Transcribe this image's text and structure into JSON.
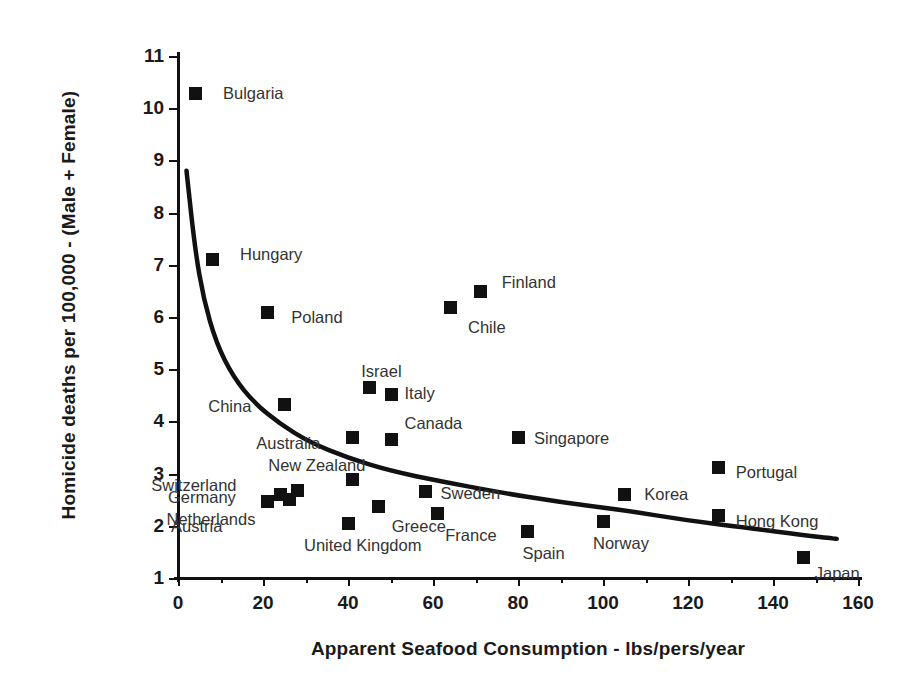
{
  "chart_data": {
    "type": "scatter",
    "title": "",
    "xlabel": "Apparent Seafood Consumption  -  lbs/pers/year",
    "ylabel": "Homicide deaths per 100,000 - (Male + Female)",
    "xlim": [
      0,
      160
    ],
    "ylim": [
      1,
      11
    ],
    "xticks": [
      0,
      20,
      40,
      60,
      80,
      100,
      120,
      140,
      160
    ],
    "yticks": [
      1,
      2,
      3,
      4,
      5,
      6,
      7,
      8,
      9,
      10,
      11
    ],
    "xtick_labels": [
      "0",
      "20",
      "40",
      "60",
      "80",
      "100",
      "120",
      "140",
      "160"
    ],
    "ytick_labels": [
      "1",
      "2",
      "3",
      "4",
      "5",
      "6",
      "7",
      "8",
      "9",
      "10",
      "11"
    ],
    "x_minor_tick_step": 10,
    "grid": false,
    "legend": "none",
    "marker_style": "filled-square",
    "marker_color": "#111111",
    "trendline": {
      "present": true,
      "style": "solid",
      "color": "#111111",
      "description": "decaying power/log curve from (2, 8.8) to (155, 1.75)",
      "points": [
        [
          2,
          8.8
        ],
        [
          4,
          7.3
        ],
        [
          6,
          6.35
        ],
        [
          9,
          5.5
        ],
        [
          13,
          4.85
        ],
        [
          18,
          4.35
        ],
        [
          24,
          3.95
        ],
        [
          31,
          3.6
        ],
        [
          40,
          3.3
        ],
        [
          50,
          3.05
        ],
        [
          62,
          2.85
        ],
        [
          75,
          2.65
        ],
        [
          90,
          2.45
        ],
        [
          105,
          2.3
        ],
        [
          120,
          2.1
        ],
        [
          135,
          1.95
        ],
        [
          147,
          1.82
        ],
        [
          155,
          1.75
        ]
      ]
    },
    "points": [
      {
        "label": "Bulgaria",
        "x": 4,
        "y": 10.3,
        "label_dx": 28,
        "label_dy": -8
      },
      {
        "label": "Hungary",
        "x": 8,
        "y": 7.12,
        "label_dx": 28,
        "label_dy": -13
      },
      {
        "label": "Poland",
        "x": 21,
        "y": 6.1,
        "label_dx": 24,
        "label_dy": -3
      },
      {
        "label": "Chile",
        "x": 64,
        "y": 6.2,
        "label_dx": 18,
        "label_dy": 12
      },
      {
        "label": "Finland",
        "x": 71,
        "y": 6.5,
        "label_dx": 22,
        "label_dy": -17
      },
      {
        "label": "Israel",
        "x": 45,
        "y": 4.66,
        "label_dx": -8,
        "label_dy": -24
      },
      {
        "label": "Italy",
        "x": 50,
        "y": 4.52,
        "label_dx": 14,
        "label_dy": -9
      },
      {
        "label": "China",
        "x": 25,
        "y": 4.33,
        "label_dx": -76,
        "label_dy": -6
      },
      {
        "label": "Australia",
        "x": 41,
        "y": 3.71,
        "label_dx": -96,
        "label_dy": -2
      },
      {
        "label": "Canada",
        "x": 50,
        "y": 3.66,
        "label_dx": 14,
        "label_dy": -24
      },
      {
        "label": "Singapore",
        "x": 80,
        "y": 3.71,
        "label_dx": 16,
        "label_dy": -7
      },
      {
        "label": "New Zealand",
        "x": 41,
        "y": 2.89,
        "label_dx": -84,
        "label_dy": -22
      },
      {
        "label": "Switzerland",
        "x": 21,
        "y": 2.48,
        "label_dx": -116,
        "label_dy": -24
      },
      {
        "label": "Germany",
        "x": 24,
        "y": 2.6,
        "label_dx": -112,
        "label_dy": -5
      },
      {
        "label": "Netherlands",
        "x": 26,
        "y": 2.52,
        "label_dx": -122,
        "label_dy": 12
      },
      {
        "label": "Austria",
        "x": 28,
        "y": 2.68,
        "label_dx": -126,
        "label_dy": 28
      },
      {
        "label": "United Kingdom",
        "x": 40,
        "y": 2.06,
        "label_dx": -44,
        "label_dy": 14
      },
      {
        "label": "Greece",
        "x": 47,
        "y": 2.37,
        "label_dx": 14,
        "label_dy": 12
      },
      {
        "label": "Sweden",
        "x": 58,
        "y": 2.66,
        "label_dx": 16,
        "label_dy": -6
      },
      {
        "label": "France",
        "x": 61,
        "y": 2.25,
        "label_dx": 8,
        "label_dy": 14
      },
      {
        "label": "Spain",
        "x": 82,
        "y": 1.9,
        "label_dx": -4,
        "label_dy": 14
      },
      {
        "label": "Norway",
        "x": 100,
        "y": 2.09,
        "label_dx": -10,
        "label_dy": 14
      },
      {
        "label": "Korea",
        "x": 105,
        "y": 2.6,
        "label_dx": 20,
        "label_dy": -8
      },
      {
        "label": "Portugal",
        "x": 127,
        "y": 3.13,
        "label_dx": 18,
        "label_dy": -3
      },
      {
        "label": "Hong Kong",
        "x": 127,
        "y": 2.2,
        "label_dx": 18,
        "label_dy": -2
      },
      {
        "label": "Japan",
        "x": 147,
        "y": 1.4,
        "label_dx": 12,
        "label_dy": 8
      }
    ]
  }
}
